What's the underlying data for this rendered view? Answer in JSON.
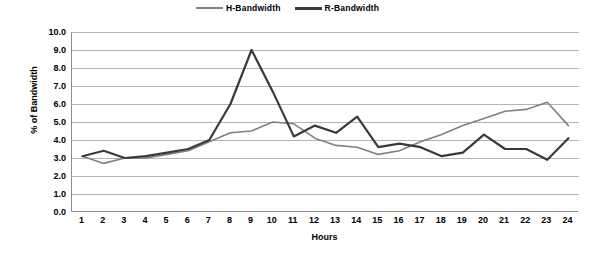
{
  "chart_data": {
    "type": "line",
    "title": "",
    "xlabel": "Hours",
    "ylabel": "% of Bandwidth",
    "x": [
      1,
      2,
      3,
      4,
      5,
      6,
      7,
      8,
      9,
      10,
      11,
      12,
      13,
      14,
      15,
      16,
      17,
      18,
      19,
      20,
      21,
      22,
      23,
      24
    ],
    "xticklabels": [
      "1",
      "2",
      "3",
      "4",
      "5",
      "6",
      "7",
      "8",
      "9",
      "10",
      "11",
      "12",
      "13",
      "14",
      "15",
      "16",
      "17",
      "18",
      "19",
      "20",
      "21",
      "22",
      "23",
      "24"
    ],
    "yticklabels": [
      "0.0",
      "1.0",
      "2.0",
      "3.0",
      "4.0",
      "5.0",
      "6.0",
      "7.0",
      "8.0",
      "9.0",
      "10.0"
    ],
    "ytickvalues": [
      0,
      1,
      2,
      3,
      4,
      5,
      6,
      7,
      8,
      9,
      10
    ],
    "ylim": [
      0,
      10
    ],
    "xlim": [
      1,
      24
    ],
    "grid": "horizontal",
    "legend_position": "top-center",
    "series": [
      {
        "name": "H-Bandwidth",
        "color": "#808080",
        "width": 1.6,
        "values": [
          3.1,
          2.7,
          3.0,
          3.0,
          3.2,
          3.4,
          3.9,
          4.4,
          4.5,
          5.0,
          4.9,
          4.1,
          3.7,
          3.6,
          3.2,
          3.4,
          3.9,
          4.3,
          4.8,
          5.2,
          5.6,
          5.7,
          6.1,
          4.8
        ]
      },
      {
        "name": "R-Bandwidth",
        "color": "#3a3a3a",
        "width": 2.2,
        "values": [
          3.1,
          3.4,
          3.0,
          3.1,
          3.3,
          3.5,
          4.0,
          6.0,
          9.0,
          6.7,
          4.2,
          4.8,
          4.4,
          5.3,
          3.6,
          3.8,
          3.6,
          3.1,
          3.3,
          4.3,
          3.5,
          3.5,
          2.9,
          4.1
        ]
      }
    ]
  },
  "legend": {
    "entries": [
      {
        "label": "H-Bandwidth"
      },
      {
        "label": "R-Bandwidth"
      }
    ]
  },
  "axes": {
    "x_title": "Hours",
    "y_title": "% of Bandwidth"
  },
  "colors": {
    "h_series": "#808080",
    "r_series": "#3a3a3a",
    "gridline": "#b3b3b3",
    "axis": "#8c8c8c",
    "background": "#ffffff"
  }
}
